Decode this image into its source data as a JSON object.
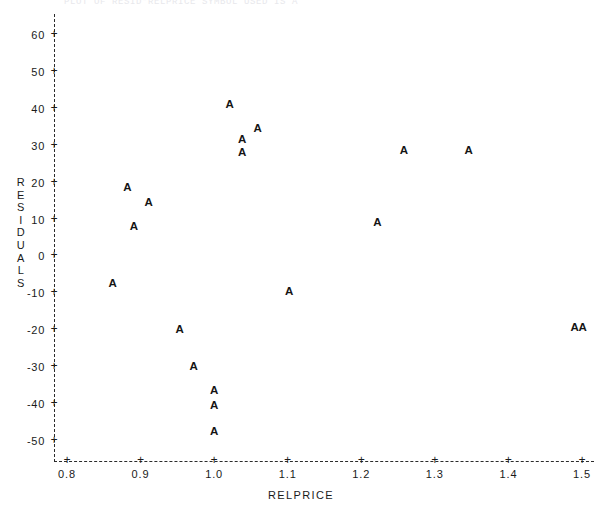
{
  "top_caption": "PLOT OF RESID*RELPRICE   SYMBOL USED IS A",
  "axes": {
    "y_title_letters": [
      "R",
      "E",
      "S",
      "I",
      "D",
      "U",
      "A",
      "L",
      "S"
    ],
    "y_title": "RESIDUALS",
    "x_title": "RELPRICE",
    "y_ticks": [
      "60",
      "50",
      "40",
      "30",
      "20",
      "10",
      "0",
      "-10",
      "-20",
      "-30",
      "-40",
      "-50"
    ],
    "x_ticks": [
      "0.8",
      "0.9",
      "1.0",
      "1.1",
      "1.2",
      "1.3",
      "1.4",
      "1.5"
    ],
    "tick_glyph": "+",
    "plot_symbol": "A"
  },
  "chart_data": {
    "type": "scatter",
    "title": "",
    "xlabel": "RELPRICE",
    "ylabel": "RESIDUALS",
    "xlim": [
      0.78,
      1.52
    ],
    "ylim": [
      -55,
      65
    ],
    "xticks": [
      0.8,
      0.9,
      1.0,
      1.1,
      1.2,
      1.3,
      1.4,
      1.5
    ],
    "yticks": [
      60,
      50,
      40,
      30,
      20,
      10,
      0,
      -10,
      -20,
      -30,
      -40,
      -50
    ],
    "grid": false,
    "legend": null,
    "marker_symbol": "A",
    "series": [
      {
        "name": "A",
        "points": [
          {
            "x": 0.862,
            "y": -7.5
          },
          {
            "x": 0.882,
            "y": 18.5
          },
          {
            "x": 0.891,
            "y": 8.0
          },
          {
            "x": 0.911,
            "y": 14.5
          },
          {
            "x": 0.953,
            "y": -20.0
          },
          {
            "x": 0.972,
            "y": -30.0
          },
          {
            "x": 1.0,
            "y": -36.5
          },
          {
            "x": 1.0,
            "y": -40.5
          },
          {
            "x": 1.0,
            "y": -47.5
          },
          {
            "x": 1.021,
            "y": 41.0
          },
          {
            "x": 1.038,
            "y": 28.0
          },
          {
            "x": 1.038,
            "y": 31.5
          },
          {
            "x": 1.059,
            "y": 34.5
          },
          {
            "x": 1.102,
            "y": -9.5
          },
          {
            "x": 1.222,
            "y": 9.0
          },
          {
            "x": 1.258,
            "y": 28.5
          },
          {
            "x": 1.346,
            "y": 28.5
          },
          {
            "x": 1.49,
            "y": -19.5
          },
          {
            "x": 1.501,
            "y": -19.5
          }
        ]
      }
    ]
  }
}
